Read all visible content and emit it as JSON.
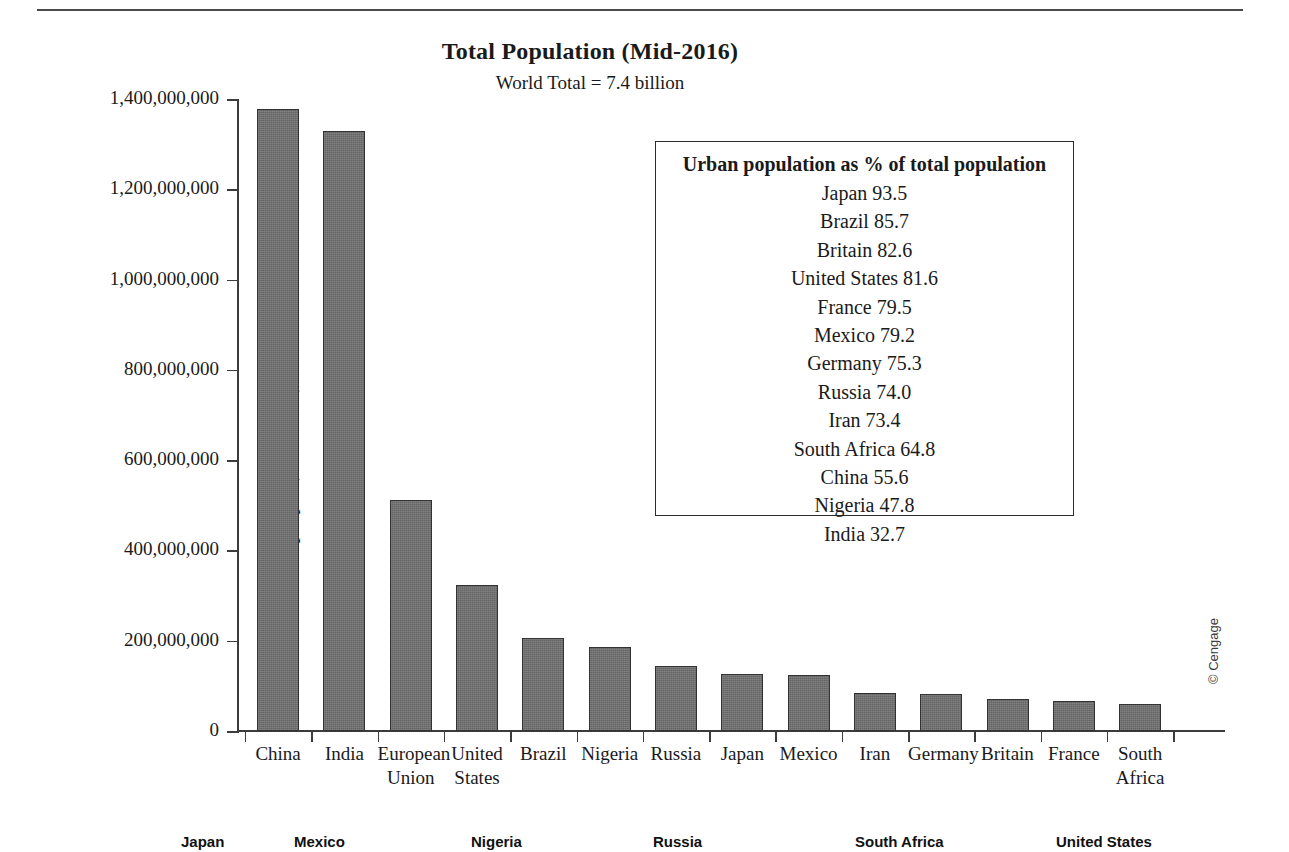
{
  "chart_data": {
    "type": "bar",
    "title": "Total Population (Mid-2016)",
    "subtitle": "World Total = 7.4 billion",
    "xlabel": "",
    "ylabel": "Number of people (in millions)",
    "ylim": [
      0,
      1400000000
    ],
    "grid": false,
    "categories": [
      "China",
      "India",
      "European Union",
      "United States",
      "Brazil",
      "Nigeria",
      "Russia",
      "Japan",
      "Mexico",
      "Iran",
      "Germany",
      "Britain",
      "France",
      "South Africa"
    ],
    "values": [
      1378000000,
      1329000000,
      511000000,
      324000000,
      206000000,
      187000000,
      144000000,
      127000000,
      123000000,
      85000000,
      82000000,
      71000000,
      67000000,
      59000000
    ],
    "y_ticks": [
      {
        "value": 0,
        "label": "0"
      },
      {
        "value": 200000000,
        "label": "200,000,000"
      },
      {
        "value": 400000000,
        "label": "400,000,000"
      },
      {
        "value": 600000000,
        "label": "600,000,000"
      },
      {
        "value": 800000000,
        "label": "800,000,000"
      },
      {
        "value": 1000000000,
        "label": "1,000,000,000"
      },
      {
        "value": 1200000000,
        "label": "1,200,000,000"
      },
      {
        "value": 1400000000,
        "label": "1,400,000,000"
      }
    ],
    "bar_color": "#6e6e6e",
    "bar_edge_color": "#333333"
  },
  "inset": {
    "title": "Urban population as % of total population",
    "rows": [
      {
        "country": "Japan",
        "percent": "93.5",
        "text": "Japan 93.5"
      },
      {
        "country": "Brazil",
        "percent": "85.7",
        "text": "Brazil 85.7"
      },
      {
        "country": "Britain",
        "percent": "82.6",
        "text": "Britain 82.6"
      },
      {
        "country": "United States",
        "percent": "81.6",
        "text": "United States 81.6"
      },
      {
        "country": "France",
        "percent": "79.5",
        "text": "France 79.5"
      },
      {
        "country": "Mexico",
        "percent": "79.2",
        "text": "Mexico 79.2"
      },
      {
        "country": "Germany",
        "percent": "75.3",
        "text": "Germany 75.3"
      },
      {
        "country": "Russia",
        "percent": "74.0",
        "text": "Russia 74.0"
      },
      {
        "country": "Iran",
        "percent": "73.4",
        "text": "Iran 73.4"
      },
      {
        "country": "South Africa",
        "percent": "64.8",
        "text": "South Africa 64.8"
      },
      {
        "country": "China",
        "percent": "55.6",
        "text": "China 55.6"
      },
      {
        "country": "Nigeria",
        "percent": "47.8",
        "text": "Nigeria 47.8"
      },
      {
        "country": "India",
        "percent": "32.7",
        "text": "India 32.7"
      }
    ]
  },
  "credit": "© Cengage",
  "footer": {
    "items": [
      {
        "label": "Japan",
        "x": 181
      },
      {
        "label": "Mexico",
        "x": 294
      },
      {
        "label": "Nigeria",
        "x": 471
      },
      {
        "label": "Russia",
        "x": 653
      },
      {
        "label": "South Africa",
        "x": 855
      },
      {
        "label": "United States",
        "x": 1056
      }
    ]
  }
}
